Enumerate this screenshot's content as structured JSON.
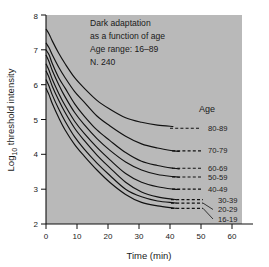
{
  "figure": {
    "background_color": "#ffffff",
    "plot_background_color": "#b9b9b9",
    "curve_color": "#111111"
  },
  "annotation": {
    "line1": "Dark adaptation",
    "line2": "as a function of age",
    "line3": "Age range: 16–89",
    "line4": "N. 240"
  },
  "legend": {
    "title": "Age"
  },
  "axes": {
    "xlabel": "Time (min)",
    "ylabel_main": "Log",
    "ylabel_sub": "10",
    "ylabel_rest": " threshold intensity",
    "xticks": [
      "0",
      "10",
      "20",
      "30",
      "40",
      "50",
      "60"
    ],
    "yticks": [
      "2",
      "3",
      "4",
      "5",
      "6",
      "7",
      "8"
    ]
  },
  "chart_data": {
    "type": "line",
    "title": "Dark adaptation as a function of age",
    "subtitle": "Age range: 16–89, N. 240",
    "xlabel": "Time (min)",
    "ylabel": "Log10 threshold intensity",
    "xlim": [
      0,
      65
    ],
    "ylim": [
      2,
      8
    ],
    "xticks": [
      0,
      10,
      20,
      30,
      40,
      50,
      60
    ],
    "yticks": [
      2,
      3,
      4,
      5,
      6,
      7,
      8
    ],
    "grid": false,
    "legend": "right-inline-labels",
    "series": [
      {
        "name": "80-89",
        "plateau": 4.75,
        "solid_end_x": 40,
        "dash_end_x": 51,
        "x": [
          0,
          1,
          2,
          4,
          6,
          9,
          12,
          16,
          20,
          25,
          30,
          35,
          40
        ],
        "y": [
          7.6,
          7.45,
          7.25,
          6.9,
          6.6,
          6.2,
          5.9,
          5.55,
          5.3,
          5.05,
          4.92,
          4.84,
          4.8
        ]
      },
      {
        "name": "70-79",
        "plateau": 4.1,
        "solid_end_x": 42,
        "dash_end_x": 52,
        "x": [
          0,
          1,
          2,
          4,
          6,
          9,
          12,
          16,
          20,
          25,
          30,
          35,
          40,
          42
        ],
        "y": [
          7.2,
          7.05,
          6.85,
          6.5,
          6.2,
          5.8,
          5.5,
          5.1,
          4.82,
          4.52,
          4.3,
          4.18,
          4.1,
          4.08
        ]
      },
      {
        "name": "60-69",
        "plateau": 3.6,
        "solid_end_x": 42,
        "dash_end_x": 52,
        "x": [
          0,
          1,
          2,
          4,
          6,
          9,
          12,
          16,
          20,
          25,
          30,
          35,
          40,
          42
        ],
        "y": [
          7.0,
          6.85,
          6.6,
          6.2,
          5.9,
          5.45,
          5.1,
          4.7,
          4.4,
          4.05,
          3.8,
          3.68,
          3.6,
          3.58
        ]
      },
      {
        "name": "50-59",
        "plateau": 3.35,
        "solid_end_x": 42,
        "dash_end_x": 52,
        "x": [
          0,
          1,
          2,
          4,
          6,
          9,
          12,
          16,
          20,
          25,
          30,
          35,
          40,
          42
        ],
        "y": [
          6.85,
          6.65,
          6.4,
          6.0,
          5.65,
          5.2,
          4.85,
          4.45,
          4.12,
          3.78,
          3.55,
          3.42,
          3.36,
          3.34
        ]
      },
      {
        "name": "40-49",
        "plateau": 3.0,
        "solid_end_x": 42,
        "dash_end_x": 52,
        "x": [
          0,
          1,
          2,
          4,
          6,
          9,
          12,
          16,
          20,
          25,
          30,
          35,
          40,
          42
        ],
        "y": [
          6.6,
          6.4,
          6.15,
          5.75,
          5.4,
          4.95,
          4.6,
          4.2,
          3.85,
          3.45,
          3.2,
          3.07,
          3.0,
          2.99
        ]
      },
      {
        "name": "30-39",
        "plateau": 2.7,
        "solid_end_x": 41,
        "dash_end_x": 52,
        "x": [
          0,
          1,
          2,
          4,
          6,
          9,
          12,
          16,
          20,
          25,
          30,
          35,
          40,
          41
        ],
        "y": [
          6.4,
          6.2,
          5.95,
          5.55,
          5.2,
          4.75,
          4.4,
          3.98,
          3.62,
          3.2,
          2.92,
          2.78,
          2.71,
          2.7
        ]
      },
      {
        "name": "20-29",
        "plateau": 2.6,
        "solid_end_x": 41,
        "dash_end_x": 52,
        "x": [
          0,
          1,
          2,
          4,
          6,
          9,
          12,
          16,
          20,
          25,
          30,
          35,
          40,
          41
        ],
        "y": [
          6.15,
          5.95,
          5.7,
          5.3,
          4.95,
          4.5,
          4.15,
          3.75,
          3.4,
          3.0,
          2.78,
          2.66,
          2.61,
          2.6
        ]
      },
      {
        "name": "16-19",
        "plateau": 2.45,
        "solid_end_x": 41,
        "dash_end_x": 52,
        "x": [
          0,
          1,
          2,
          4,
          6,
          9,
          12,
          16,
          20,
          25,
          30,
          35,
          40,
          41
        ],
        "y": [
          5.9,
          5.7,
          5.45,
          5.05,
          4.7,
          4.28,
          3.95,
          3.55,
          3.2,
          2.85,
          2.62,
          2.52,
          2.46,
          2.45
        ]
      }
    ]
  }
}
